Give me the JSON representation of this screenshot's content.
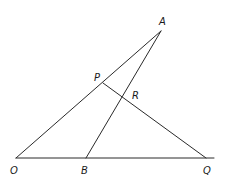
{
  "diagram": {
    "type": "geometry",
    "width": 227,
    "height": 182,
    "stroke_color": "#2a2a2a",
    "label_color": "#1a1a1a",
    "points": {
      "A": {
        "x": 161,
        "y": 31,
        "label": "A",
        "lx": 159,
        "ly": 25
      },
      "P": {
        "x": 103,
        "y": 83,
        "label": "P",
        "lx": 94,
        "ly": 81
      },
      "R": {
        "x": 123,
        "y": 97,
        "label": "R",
        "lx": 132,
        "ly": 99
      },
      "O": {
        "x": 16,
        "y": 158,
        "label": "O",
        "lx": 10,
        "ly": 174
      },
      "B": {
        "x": 86,
        "y": 158,
        "label": "B",
        "lx": 81,
        "ly": 174
      },
      "Q": {
        "x": 206,
        "y": 158,
        "label": "Q",
        "lx": 203,
        "ly": 174
      }
    },
    "segments": [
      {
        "name": "segment-OA",
        "from": "O",
        "to": "A"
      },
      {
        "name": "segment-BA",
        "from": "B",
        "to": "A"
      },
      {
        "name": "segment-PQ",
        "from": "P",
        "to": "Q"
      },
      {
        "name": "segment-OQ-extended",
        "x1": 16,
        "y1": 158,
        "x2": 214,
        "y2": 158
      }
    ]
  }
}
